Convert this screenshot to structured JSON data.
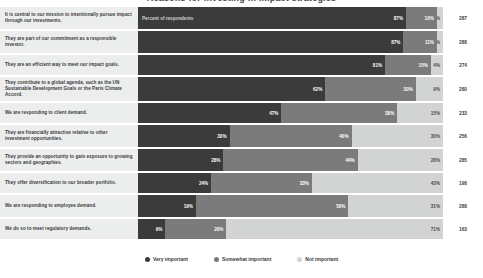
{
  "title": "Reasons for investing in impact strategies",
  "inbar_note": "Percent of respondents",
  "legend": {
    "position": "bottom-center",
    "items": [
      {
        "label": "Very important",
        "color": "#3b3b3c",
        "icon": "circle-dot-icon"
      },
      {
        "label": "Somewhat important",
        "color": "#7b7b7c",
        "icon": "circle-dot-icon"
      },
      {
        "label": "Not important",
        "color": "#d2d3d3",
        "icon": "circle-dot-icon"
      }
    ]
  },
  "n_column_header": "",
  "chart_data": {
    "type": "bar",
    "subtype": "100% stacked horizontal bar",
    "title": "Reasons for investing in impact strategies",
    "xlabel": "Percent of respondents",
    "ylabel": "",
    "xlim": [
      0,
      100
    ],
    "grid": false,
    "legend_position": "bottom-center",
    "value_suffix": "%",
    "categories": [
      "It is central to our mission to intentionally pursue impact through our investments.",
      "They are part of our commitment as a responsible investor.",
      "They are an efficient way to meet our impact goals.",
      "They contribute to a global agenda, such as the UN Sustainable Development Goals or the Paris Climate Accord.",
      "We are responding to client demand.",
      "They are financially attractive relative to other investment opportunities.",
      "They provide an opportunity to gain exposure to growing sectors and geographies.",
      "They offer diversification to our broader portfolio.",
      "We are responding to employee demand.",
      "We do so to meet regulatory demands."
    ],
    "series": [
      {
        "name": "Very important",
        "color": "#3b3b3c",
        "values": [
          87,
          87,
          81,
          62,
          47,
          30,
          28,
          24,
          19,
          9
        ]
      },
      {
        "name": "Somewhat important",
        "color": "#7b7b7c",
        "values": [
          10,
          11,
          15,
          30,
          38,
          40,
          44,
          33,
          50,
          20
        ]
      },
      {
        "name": "Not important",
        "color": "#d2d3d3",
        "values": [
          2,
          2,
          4,
          9,
          15,
          30,
          28,
          43,
          31,
          71
        ]
      }
    ],
    "n_values": [
      287,
      288,
      274,
      280,
      233,
      256,
      285,
      198,
      288,
      163
    ]
  }
}
